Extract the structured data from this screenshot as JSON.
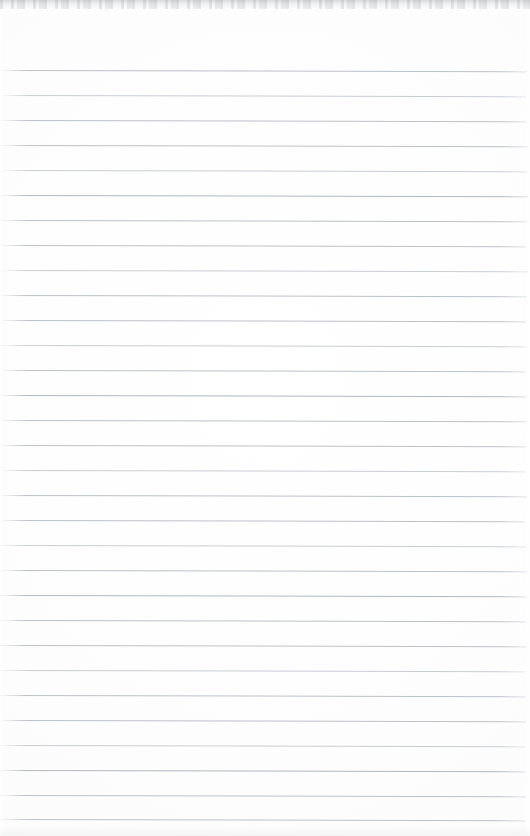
{
  "page": {
    "kind": "lined-paper-scan",
    "width_px": 530,
    "height_px": 836,
    "paper_color": "#fdfdfd",
    "background_color": "#ffffff",
    "caption": "",
    "visible_text": ""
  },
  "ruling": {
    "line_color": "#b9bec6",
    "line_color_faint": "#c7cbd2",
    "line_color_dark": "#aeb4bd",
    "line_thickness_px": 1,
    "line_spacing_px": 25,
    "first_line_y_px": 70,
    "last_line_y_px": 820,
    "line_count": 31,
    "top_margin_px": 70,
    "left_inset_px": 2,
    "right_inset_px": 3,
    "skew_degrees": 0.13,
    "lines": [
      {
        "y": 70,
        "tone": "normal",
        "left": 2,
        "right": 3
      },
      {
        "y": 95,
        "tone": "faint",
        "left": 3,
        "right": 4
      },
      {
        "y": 120,
        "tone": "normal",
        "left": 2,
        "right": 3
      },
      {
        "y": 145,
        "tone": "normal",
        "left": 2,
        "right": 2
      },
      {
        "y": 170,
        "tone": "faint",
        "left": 4,
        "right": 3
      },
      {
        "y": 195,
        "tone": "dark",
        "left": 2,
        "right": 2
      },
      {
        "y": 220,
        "tone": "normal",
        "left": 3,
        "right": 3
      },
      {
        "y": 245,
        "tone": "normal",
        "left": 2,
        "right": 4
      },
      {
        "y": 270,
        "tone": "faint",
        "left": 3,
        "right": 2
      },
      {
        "y": 295,
        "tone": "normal",
        "left": 2,
        "right": 3
      },
      {
        "y": 320,
        "tone": "normal",
        "left": 3,
        "right": 3
      },
      {
        "y": 345,
        "tone": "faint",
        "left": 2,
        "right": 2
      },
      {
        "y": 370,
        "tone": "normal",
        "left": 3,
        "right": 4
      },
      {
        "y": 395,
        "tone": "dark",
        "left": 2,
        "right": 3
      },
      {
        "y": 420,
        "tone": "normal",
        "left": 3,
        "right": 2
      },
      {
        "y": 445,
        "tone": "normal",
        "left": 2,
        "right": 3
      },
      {
        "y": 470,
        "tone": "faint",
        "left": 3,
        "right": 3
      },
      {
        "y": 495,
        "tone": "normal",
        "left": 2,
        "right": 2
      },
      {
        "y": 520,
        "tone": "normal",
        "left": 3,
        "right": 4
      },
      {
        "y": 545,
        "tone": "faint",
        "left": 2,
        "right": 3
      },
      {
        "y": 570,
        "tone": "normal",
        "left": 3,
        "right": 2
      },
      {
        "y": 595,
        "tone": "dark",
        "left": 2,
        "right": 3
      },
      {
        "y": 620,
        "tone": "normal",
        "left": 3,
        "right": 3
      },
      {
        "y": 645,
        "tone": "normal",
        "left": 2,
        "right": 2
      },
      {
        "y": 670,
        "tone": "faint",
        "left": 3,
        "right": 4
      },
      {
        "y": 695,
        "tone": "normal",
        "left": 2,
        "right": 3
      },
      {
        "y": 720,
        "tone": "normal",
        "left": 3,
        "right": 2
      },
      {
        "y": 745,
        "tone": "faint",
        "left": 2,
        "right": 3
      },
      {
        "y": 770,
        "tone": "dark",
        "left": 3,
        "right": 3
      },
      {
        "y": 795,
        "tone": "normal",
        "left": 2,
        "right": 2
      },
      {
        "y": 819,
        "tone": "normal",
        "left": 3,
        "right": 3
      }
    ]
  },
  "artifacts": {
    "top_edge_band": true,
    "bottom_edge_band": true,
    "left_edge_band": true,
    "right_edge_band": true
  }
}
